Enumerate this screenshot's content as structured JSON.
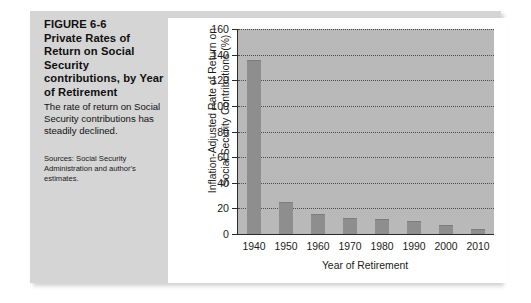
{
  "figure": {
    "label": "FIGURE 6-6",
    "heading": "Private Rates of Return on Social Security contributions, by Year of Retirement",
    "description": "The rate of return on Social Security contributions has steadily declined.",
    "source": "Sources: Social Security Administration and author's estimates."
  },
  "colors": {
    "panel_background": "#d5d5d5",
    "card_background": "#ffffff",
    "plot_background": "#b9b9b9",
    "bar_fill": "#8e8e8e",
    "axis_line": "#2b2b2b",
    "gridline": "#3a3a3a",
    "text": "#1b1b1b"
  },
  "chart_data": {
    "type": "bar",
    "title": "",
    "xlabel": "Year of Retirement",
    "ylabel": "Inflation-Adjusted Rate of Return on Social Security Contributions (%)",
    "ylabel_lines": [
      "Inflation-Adjusted Rate of Return on",
      "Social Security Contributions (%)"
    ],
    "categories": [
      "1940",
      "1950",
      "1960",
      "1970",
      "1980",
      "1990",
      "2000",
      "2010"
    ],
    "values": [
      135,
      24,
      15,
      12,
      11,
      9,
      6,
      3
    ],
    "ylim": [
      0,
      160
    ],
    "yticks": [
      0,
      20,
      40,
      60,
      80,
      100,
      120,
      140,
      160
    ],
    "ytick_labels": [
      "0",
      "20",
      "40",
      "60",
      "80",
      "100",
      "120",
      "140",
      "160"
    ],
    "grid": true,
    "grid_axis": "y",
    "legend": false
  }
}
